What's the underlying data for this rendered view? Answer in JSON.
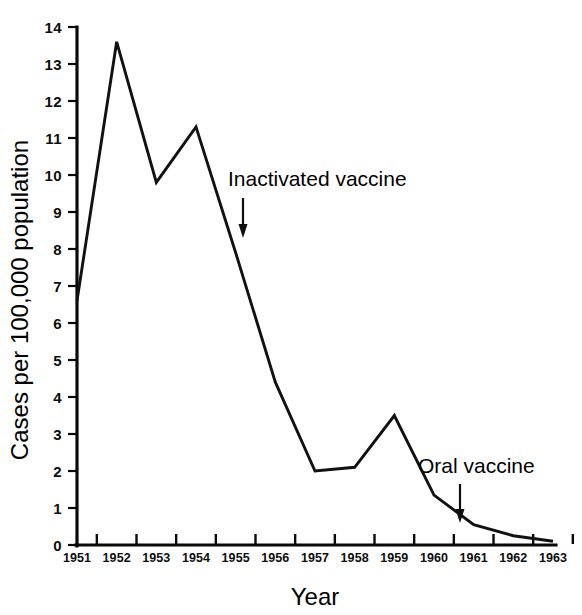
{
  "chart_data": {
    "type": "line",
    "title": "",
    "xlabel": "Year",
    "ylabel": "Cases per 100,000 population",
    "x": [
      "1951",
      "1952",
      "1953",
      "1954",
      "1955",
      "1956",
      "1957",
      "1958",
      "1959",
      "1960",
      "1961",
      "1962",
      "1963"
    ],
    "categories": [
      "1951",
      "1952",
      "1953",
      "1954",
      "1955",
      "1956",
      "1957",
      "1958",
      "1959",
      "1960",
      "1961",
      "1962",
      "1963"
    ],
    "values": [
      6.6,
      13.6,
      9.8,
      11.3,
      7.9,
      4.4,
      2.0,
      2.1,
      3.5,
      1.35,
      0.55,
      0.25,
      0.1
    ],
    "series": [
      {
        "name": "Paralytic poliomyelitis cases",
        "values": [
          6.6,
          13.6,
          9.8,
          11.3,
          7.9,
          4.4,
          2.0,
          2.1,
          3.5,
          1.35,
          0.55,
          0.25,
          0.1
        ]
      }
    ],
    "ylim": [
      0,
      14
    ],
    "xlim": [
      "1951",
      "1963"
    ],
    "ytick_labels": [
      "0",
      "1",
      "2",
      "3",
      "4",
      "5",
      "6",
      "7",
      "8",
      "9",
      "10",
      "11",
      "12",
      "13",
      "14"
    ],
    "ytick_values": [
      0,
      1,
      2,
      3,
      4,
      5,
      6,
      7,
      8,
      9,
      10,
      11,
      12,
      13,
      14
    ],
    "grid": false,
    "legend": "none",
    "line_color": "#111111",
    "axis_color": "#0a0a0a",
    "background_color": "#ffffff",
    "annotations": [
      {
        "id": "inactivated-vaccine",
        "text": "Inactivated vaccine",
        "arrow_points_to_year": "1955",
        "arrow_points_to_value": 8.5
      },
      {
        "id": "oral-vaccine",
        "text": "Oral vaccine",
        "arrow_points_to_year": "1961",
        "arrow_points_to_value": 0.6
      }
    ]
  },
  "axes": {
    "y_title": "Cases per 100,000 population",
    "x_title": "Year"
  },
  "annotations": {
    "inactivated": "Inactivated vaccine",
    "oral": "Oral vaccine"
  }
}
